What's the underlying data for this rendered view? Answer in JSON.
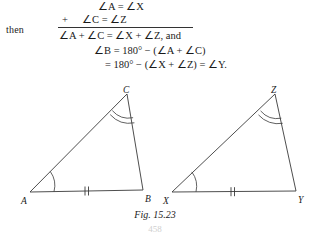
{
  "page": {
    "width": 310,
    "height": 233,
    "background": "#ffffff",
    "ink": "#1a1a1a"
  },
  "proof": {
    "then_label": "then",
    "plus_sign": "+",
    "lines": [
      {
        "name": "line-1",
        "text": "∠A = ∠X"
      },
      {
        "name": "line-2",
        "text": "∠C = ∠Z"
      },
      {
        "name": "line-3",
        "text": "∠A + ∠C = ∠X + ∠Z, and"
      },
      {
        "name": "line-4",
        "text": "∠B = 180° − (∠A + ∠C)"
      },
      {
        "name": "line-5",
        "text": "= 180° − (∠X + ∠Z) = ∠Y."
      }
    ]
  },
  "figure": {
    "caption": "Fig. 15.23",
    "folio": "458",
    "stroke_color": "#3a3a3a",
    "triangles": [
      {
        "name": "left-triangle",
        "vertices": [
          {
            "label": "A",
            "x": 30,
            "y": 192,
            "marks": "single-arc",
            "label_dx": -9,
            "label_dy": 4
          },
          {
            "label": "B",
            "x": 143,
            "y": 190,
            "marks": "none",
            "label_dx": 2,
            "label_dy": 4
          },
          {
            "label": "C",
            "x": 127,
            "y": 94,
            "marks": "double-arc",
            "label_dx": -3,
            "label_dy": -3
          }
        ],
        "side_ticks": {
          "side": "A-B",
          "count": 2
        }
      },
      {
        "name": "right-triangle",
        "vertices": [
          {
            "label": "X",
            "x": 172,
            "y": 192,
            "marks": "single-arc",
            "label_dx": -9,
            "label_dy": 4
          },
          {
            "label": "Y",
            "x": 296,
            "y": 191,
            "marks": "none",
            "label_dx": 2,
            "label_dy": 4
          },
          {
            "label": "Z",
            "x": 275,
            "y": 94,
            "marks": "double-arc",
            "label_dx": -3,
            "label_dy": -3
          }
        ],
        "side_ticks": {
          "side": "X-Y",
          "count": 2
        }
      }
    ]
  }
}
